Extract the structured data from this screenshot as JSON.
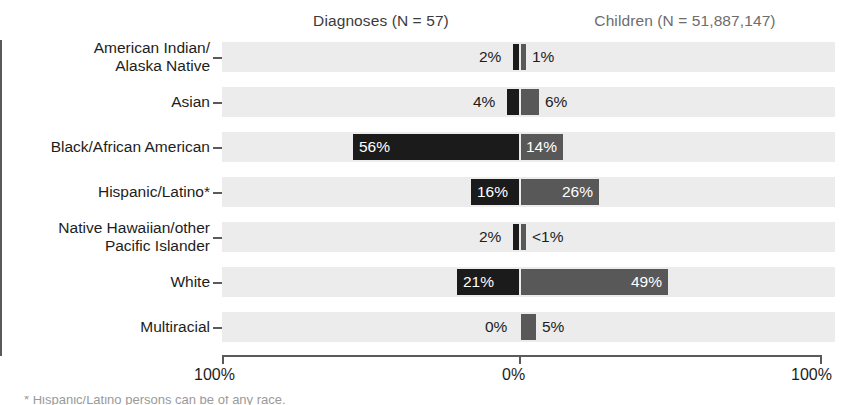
{
  "header": {
    "left_label": "Diagnoses (N = 57)",
    "right_label": "Children (N = 51,887,147)"
  },
  "axis": {
    "left_tick": "100%",
    "center_tick": "0%",
    "right_tick": "100%"
  },
  "footnote": {
    "text": "* Hispanic/Latino persons can be of any race."
  },
  "colors": {
    "diagnoses_bar": "#1b1b1b",
    "children_bar": "#585858",
    "row_band": "#ececec",
    "axis": "#5a5a5a"
  },
  "chart_data": {
    "type": "bar",
    "title": "",
    "subtitle": "",
    "orientation": "horizontal-diverging",
    "xlabel": "",
    "ylabel": "",
    "xlim": [
      -100,
      100
    ],
    "grid": false,
    "legend_position": "top",
    "tick_labels": [
      "100%",
      "0%",
      "100%"
    ],
    "categories": [
      "American Indian/\nAlaska Native",
      "Asian",
      "Black/African American",
      "Hispanic/Latino*",
      "Native Hawaiian/other\nPacific Islander",
      "White",
      "Multiracial"
    ],
    "series": [
      {
        "name": "Diagnoses (N = 57)",
        "direction": "left",
        "color": "#1b1b1b",
        "values": [
          2,
          4,
          56,
          16,
          2,
          21,
          0
        ],
        "labels": [
          "2%",
          "4%",
          "56%",
          "16%",
          "2%",
          "21%",
          "0%"
        ]
      },
      {
        "name": "Children (N = 51,887,147)",
        "direction": "right",
        "color": "#585858",
        "values": [
          1,
          6,
          14,
          26,
          0.4,
          49,
          5
        ],
        "labels": [
          "1%",
          "6%",
          "14%",
          "26%",
          "<1%",
          "49%",
          "5%"
        ]
      }
    ]
  },
  "rows": [
    {
      "label": "American Indian/\nAlaska Native",
      "left_value": 2,
      "left_label": "2%",
      "left_label_inside": false,
      "right_value": 1,
      "right_label": "1%",
      "right_label_inside": false
    },
    {
      "label": "Asian",
      "left_value": 4,
      "left_label": "4%",
      "left_label_inside": false,
      "right_value": 6,
      "right_label": "6%",
      "right_label_inside": false
    },
    {
      "label": "Black/African American",
      "left_value": 56,
      "left_label": "56%",
      "left_label_inside": true,
      "right_value": 14,
      "right_label": "14%",
      "right_label_inside": true
    },
    {
      "label": "Hispanic/Latino*",
      "left_value": 16,
      "left_label": "16%",
      "left_label_inside": true,
      "right_value": 26,
      "right_label": "26%",
      "right_label_inside": true
    },
    {
      "label": "Native Hawaiian/other\nPacific Islander",
      "left_value": 2,
      "left_label": "2%",
      "left_label_inside": false,
      "right_value": 0.4,
      "right_label": "<1%",
      "right_label_inside": false
    },
    {
      "label": "White",
      "left_value": 21,
      "left_label": "21%",
      "left_label_inside": true,
      "right_value": 49,
      "right_label": "49%",
      "right_label_inside": true
    },
    {
      "label": "Multiracial",
      "left_value": 0,
      "left_label": "0%",
      "left_label_inside": false,
      "right_value": 5,
      "right_label": "5%",
      "right_label_inside": false
    }
  ]
}
